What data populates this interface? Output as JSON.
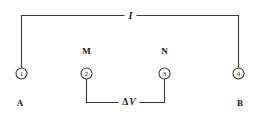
{
  "figure": {
    "background_color": "#ffffff",
    "line_color": "#3b3b3b",
    "text_color": "#1a1a1a",
    "width": 259,
    "height": 125
  },
  "labels": {
    "current": "I",
    "voltage": "Δ",
    "voltage_symbol": "V",
    "terminal_left": "A",
    "terminal_right": "B",
    "node_m": "M",
    "node_n": "N"
  },
  "electrodes": [
    {
      "id": "electrode-1",
      "number": "1",
      "cx": 21.5,
      "cy": 73.5,
      "r": 5.5
    },
    {
      "id": "electrode-2",
      "number": "2",
      "cx": 86.5,
      "cy": 73.5,
      "r": 5.5
    },
    {
      "id": "electrode-3",
      "number": "3",
      "cx": 164.5,
      "cy": 73.5,
      "r": 5.5
    },
    {
      "id": "electrode-4",
      "number": "4",
      "cx": 238.5,
      "cy": 73.5,
      "r": 5.5
    }
  ],
  "wires": {
    "current_loop_top_y": 15.5,
    "current_loop_left_x": 21.5,
    "current_loop_right_x": 238.5,
    "voltage_loop_bottom_y": 102.5,
    "voltage_loop_left_x": 86.5,
    "voltage_loop_right_x": 164.5,
    "current_gap": [
      124,
      137
    ],
    "voltage_gap": [
      118,
      140
    ]
  }
}
